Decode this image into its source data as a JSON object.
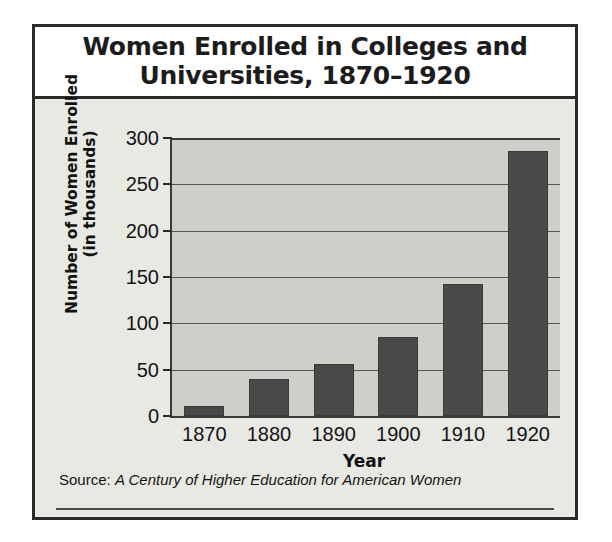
{
  "chart_data": {
    "type": "bar",
    "title_lines": [
      "Women Enrolled in Colleges and",
      "Universities, 1870–1920"
    ],
    "categories": [
      "1870",
      "1880",
      "1890",
      "1900",
      "1910",
      "1920"
    ],
    "values": [
      11,
      40,
      56,
      85,
      142,
      286
    ],
    "xlabel": "Year",
    "ylabel": "Number of Women Enrolled (in thousands)",
    "ylabel_lines": [
      "Number of Women Enrolled",
      "(in thousands)"
    ],
    "ylim": [
      0,
      300
    ],
    "yticks": [
      "300",
      "250",
      "200",
      "150",
      "100",
      "50",
      "0"
    ],
    "ytick_values": [
      300,
      250,
      200,
      150,
      100,
      50,
      0
    ],
    "grid": "horizontal",
    "legend": "none",
    "bar_color": "#494949",
    "plot_background": "#cfcfca",
    "panel_background": "#e9e9e4"
  },
  "source": {
    "label": "Source:",
    "title": "A Century of Higher Education for American Women"
  }
}
